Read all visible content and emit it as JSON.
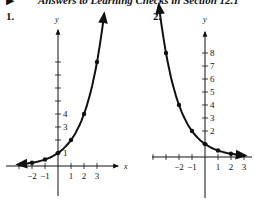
{
  "header": {
    "bullet": "▶",
    "title": "Answers to Learning Checks in Section 12.1"
  },
  "graphs": [
    {
      "number": "1.",
      "y_label": "y",
      "x_label": "x"
    },
    {
      "number": "2.",
      "y_label": "y",
      "x_label": ""
    }
  ],
  "chart_data": [
    {
      "type": "line",
      "title": "1.",
      "xlabel": "x",
      "ylabel": "y",
      "function": "y = 2^x",
      "x_ticks": [
        -2,
        -1,
        1,
        2,
        3
      ],
      "y_tick_labels": [
        1,
        3,
        4
      ],
      "y_tick_count": 8,
      "points": [
        [
          -2,
          0.25
        ],
        [
          -1,
          0.5
        ],
        [
          0,
          1
        ],
        [
          1,
          2
        ],
        [
          2,
          4
        ],
        [
          3,
          8
        ]
      ],
      "xlim": [
        -3.2,
        4.6
      ],
      "ylim": [
        -3,
        10.5
      ],
      "grid": false,
      "arrows": "both ends of curve, positive ends of axes"
    },
    {
      "type": "line",
      "title": "2.",
      "xlabel": "",
      "ylabel": "y",
      "function": "y = (1/2)^x",
      "x_ticks": [
        -2,
        -1,
        1,
        2,
        3
      ],
      "y_tick_labels": [
        2,
        3,
        4,
        5,
        6,
        7,
        8
      ],
      "points": [
        [
          -3,
          8
        ],
        [
          -2,
          4
        ],
        [
          -1,
          2
        ],
        [
          0,
          1
        ],
        [
          1,
          0.5
        ],
        [
          2,
          0.25
        ],
        [
          2.5,
          0.18
        ]
      ],
      "xlim": [
        -4.5,
        3.5
      ],
      "ylim": [
        -3.5,
        10.5
      ],
      "grid": false,
      "arrows": "both ends of curve, positive end of y axis"
    }
  ]
}
